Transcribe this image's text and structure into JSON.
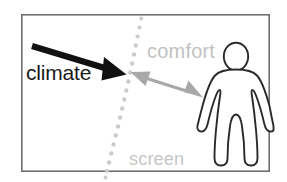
{
  "figure": {
    "type": "diagram",
    "title": "",
    "canvas": {
      "width": 287,
      "height": 182,
      "background": "#ffffff"
    },
    "frame": {
      "name": "diagram-border",
      "x": 21,
      "y": 14,
      "width": 249,
      "height": 158,
      "stroke": "#6e6e6e",
      "stroke_width": 1.6,
      "fill": "#ffffff"
    }
  },
  "labels": {
    "climate": "climate",
    "comfort": "comfort",
    "screen": "screen"
  },
  "colors": {
    "climate_arrow": "#111111",
    "climate_text": "#1a1a1a",
    "comfort_text": "#c2c2c2",
    "comfort_arrow": "#a8a8a8",
    "screen_dots": "#cccccc",
    "screen_text": "#c6c6c6",
    "person_stroke": "#2a2a2a",
    "person_fill": "#ffffff",
    "frame_stroke": "#6e6e6e"
  },
  "elements": {
    "climate_arrow": {
      "name": "climate-arrow",
      "description": "thick black arrow pointing down-right toward the screen",
      "from": [
        32,
        46
      ],
      "to": [
        126,
        74
      ],
      "stroke_width": 6,
      "head_length": 26,
      "head_width": 20
    },
    "comfort_arrow": {
      "name": "comfort-double-arrow",
      "description": "gray double-headed arrow between screen and person",
      "from": [
        133,
        73
      ],
      "to": [
        200,
        96
      ],
      "stroke_width": 3,
      "head_length": 17,
      "head_width": 15
    },
    "screen_line": {
      "name": "screen-dotted-curve",
      "description": "light gray dotted curve representing the screen",
      "dot_radius": 2.1,
      "dot_spacing": 9,
      "points": [
        [
          141,
          18
        ],
        [
          139,
          27
        ],
        [
          137,
          36
        ],
        [
          135,
          45
        ],
        [
          133,
          54
        ],
        [
          131,
          63
        ],
        [
          129,
          72
        ],
        [
          127,
          81
        ],
        [
          125,
          90
        ],
        [
          123,
          99
        ],
        [
          121,
          108
        ],
        [
          119,
          117
        ],
        [
          117,
          126
        ],
        [
          115,
          135
        ],
        [
          113,
          144
        ],
        [
          111,
          153
        ],
        [
          109,
          162
        ],
        [
          107,
          171
        ],
        [
          106,
          178
        ]
      ]
    },
    "person": {
      "name": "person-figure",
      "description": "outlined standing human figure facing viewer",
      "head": {
        "cx": 236,
        "cy": 56,
        "rx": 12,
        "ry": 13.5
      },
      "body_top": 68,
      "body_bottom": 167,
      "stroke_width": 1.8
    }
  }
}
